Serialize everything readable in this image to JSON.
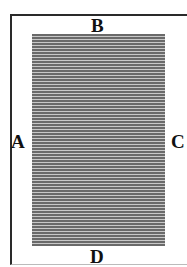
{
  "diagram": {
    "labels": {
      "top": "B",
      "left": "A",
      "right": "C",
      "bottom": "D"
    },
    "text_block": {
      "fill": "horizontal-rules",
      "rule_color": "#6a6a6a",
      "gap_color": "#c8c8c8"
    },
    "frame_color": "#2a2a2a"
  }
}
